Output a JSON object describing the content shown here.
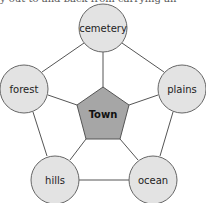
{
  "header": {
    "cropped_text": "ay out to and back from carrying an"
  },
  "diagram": {
    "center": {
      "label": "Town",
      "shape": "pentagon",
      "fill": "#a6a6a6"
    },
    "nodes": [
      {
        "id": "cemetery",
        "label": "cemetery",
        "fill": "#e3e3e3"
      },
      {
        "id": "forest",
        "label": "forest",
        "fill": "#e3e3e3"
      },
      {
        "id": "plains",
        "label": "plains",
        "fill": "#e3e3e3"
      },
      {
        "id": "hills",
        "label": "hills",
        "fill": "#e3e3e3"
      },
      {
        "id": "ocean",
        "label": "ocean",
        "fill": "#e3e3e3"
      }
    ],
    "edges": [
      [
        "Town",
        "cemetery"
      ],
      [
        "Town",
        "forest"
      ],
      [
        "Town",
        "plains"
      ],
      [
        "Town",
        "hills"
      ],
      [
        "Town",
        "ocean"
      ],
      [
        "cemetery",
        "forest"
      ],
      [
        "cemetery",
        "plains"
      ],
      [
        "forest",
        "hills"
      ],
      [
        "plains",
        "ocean"
      ],
      [
        "hills",
        "ocean"
      ]
    ],
    "stroke_color": "#555555"
  }
}
